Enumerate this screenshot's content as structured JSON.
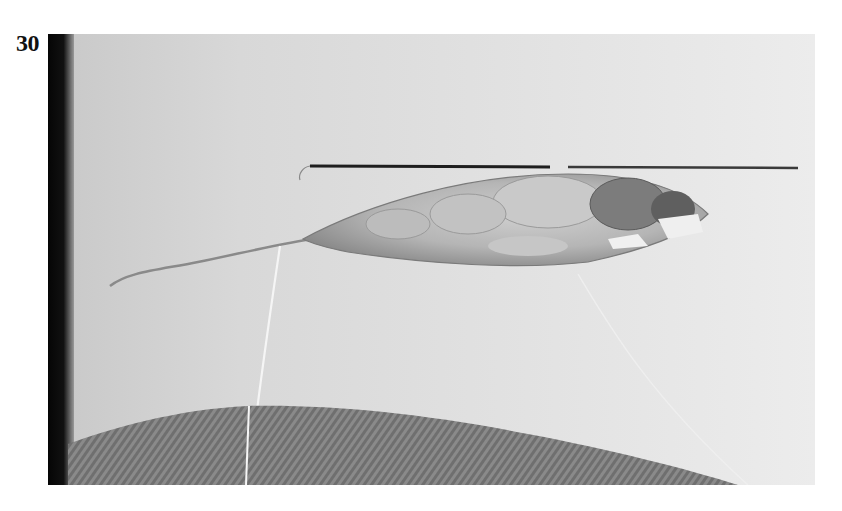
{
  "figure": {
    "number": "30",
    "type": "photograph",
    "colors": {
      "skin": "#d9d9d9",
      "skin_light": "#e8e8e8",
      "left_edge_shadow": "#0a0a0a",
      "tissue": "#bdbdbd",
      "tissue_dark": "#6e6e6e",
      "fabric": "#8c8c8c",
      "needle": "#2a2a2a",
      "thread": "#f4f4f4"
    }
  }
}
